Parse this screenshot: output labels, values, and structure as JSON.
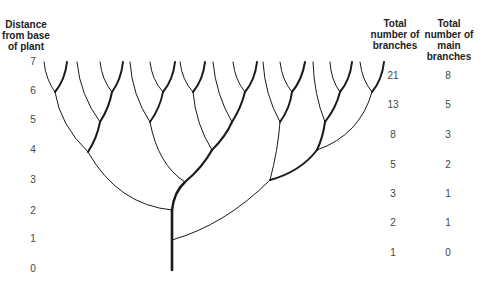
{
  "headers": {
    "distance": [
      "Distance",
      "from base",
      "of plant"
    ],
    "total_branches": [
      "Total",
      "number of",
      "branches"
    ],
    "main_branches": [
      "Total",
      "number of",
      "main",
      "branches"
    ]
  },
  "rows": [
    {
      "distance": "7",
      "total": "21",
      "main": "8"
    },
    {
      "distance": "6",
      "total": "13",
      "main": "5"
    },
    {
      "distance": "5",
      "total": "8",
      "main": "3"
    },
    {
      "distance": "4",
      "total": "5",
      "main": "2"
    },
    {
      "distance": "3",
      "total": "3",
      "main": "1"
    },
    {
      "distance": "2",
      "total": "2",
      "main": "1"
    },
    {
      "distance": "1",
      "total": "1",
      "main": "0"
    },
    {
      "distance": "0",
      "total": "",
      "main": ""
    }
  ],
  "colors": {
    "line": "#1a1a1a",
    "text": "#444444"
  }
}
